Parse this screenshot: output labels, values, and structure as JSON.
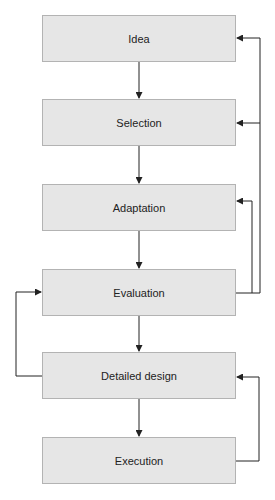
{
  "diagram": {
    "type": "flowchart",
    "colors": {
      "box_fill": "#e6e6e6",
      "box_border": "#b3b3b3",
      "line": "#222222"
    },
    "nodes": [
      {
        "id": "idea",
        "label": "Idea"
      },
      {
        "id": "selection",
        "label": "Selection"
      },
      {
        "id": "adaptation",
        "label": "Adaptation"
      },
      {
        "id": "evaluation",
        "label": "Evaluation"
      },
      {
        "id": "detailed_design",
        "label": "Detailed design"
      },
      {
        "id": "execution",
        "label": "Execution"
      }
    ],
    "edges": [
      {
        "from": "idea",
        "to": "selection"
      },
      {
        "from": "selection",
        "to": "adaptation"
      },
      {
        "from": "adaptation",
        "to": "evaluation"
      },
      {
        "from": "evaluation",
        "to": "detailed_design"
      },
      {
        "from": "detailed_design",
        "to": "execution"
      },
      {
        "from": "evaluation",
        "to": "adaptation",
        "feedback": true
      },
      {
        "from": "evaluation",
        "to": "selection",
        "feedback": true
      },
      {
        "from": "evaluation",
        "to": "idea",
        "feedback": true
      },
      {
        "from": "detailed_design",
        "to": "evaluation",
        "feedback": true
      },
      {
        "from": "execution",
        "to": "detailed_design",
        "feedback": true
      }
    ]
  }
}
